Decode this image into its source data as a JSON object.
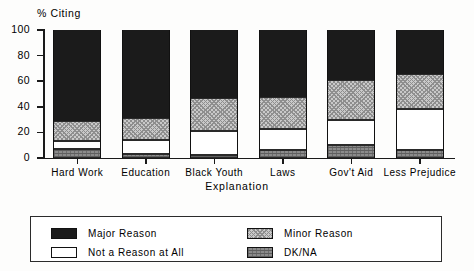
{
  "chart_data": {
    "type": "bar",
    "subtype": "stacked-bar-100",
    "title": "",
    "ylabel": "% Citing",
    "xlabel": "Explanation",
    "ylim": [
      0,
      100
    ],
    "yticks": [
      0,
      20,
      40,
      60,
      80,
      100
    ],
    "ytick_labels": [
      "0",
      "20",
      "40",
      "60",
      "80",
      "100"
    ],
    "grid": false,
    "legend_position": "bottom",
    "categories": [
      "Hard Work",
      "Education",
      "Black Youth",
      "Laws",
      "Gov't Aid",
      "Less Prejudice"
    ],
    "series": [
      {
        "name": "Major Reason",
        "key": "major",
        "color": "#1b1b1b",
        "values": [
          71,
          69,
          53,
          52,
          39,
          34
        ]
      },
      {
        "name": "Minor Reason",
        "key": "minor",
        "color": "#c9c9c9",
        "values": [
          16,
          17,
          26,
          25,
          31,
          28
        ]
      },
      {
        "name": "Not a Reason at All",
        "key": "none",
        "color": "#ffffff",
        "values": [
          6,
          11,
          19,
          17,
          20,
          32
        ]
      },
      {
        "name": "DK/NA",
        "key": "dkna",
        "color": "#8b8b8b",
        "values": [
          7,
          3,
          2,
          6,
          10,
          6
        ]
      }
    ]
  },
  "legend": {
    "entries": [
      {
        "label": "Major Reason"
      },
      {
        "label": "Minor Reason"
      },
      {
        "label": "Not a Reason at All"
      },
      {
        "label": "DK/NA"
      }
    ]
  }
}
